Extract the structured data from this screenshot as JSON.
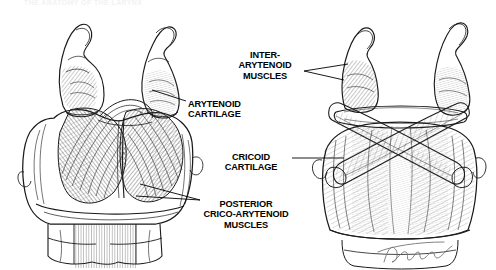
{
  "page": {
    "width": 496,
    "height": 270,
    "background_color": "#ffffff",
    "ink_color": "#1a1a1a",
    "faint_header_text": "THE ANATOMY OF THE LARYNX"
  },
  "labels": {
    "inter_arytenoid": "INTER-\nARYTENOID\nMUSCLES",
    "arytenoid_cartilage": "ARYTENOID\nCARTILAGE",
    "cricoid_cartilage": "CRICOID\nCARTILAGE",
    "posterior_crico_arytenoid": "POSTERIOR\nCRICO-ARYTENOID\nMUSCLES"
  },
  "illustrations": {
    "left": {
      "name": "posterior-larynx-view",
      "depicts": "Posterior view of larynx showing paired posterior crico-arytenoid muscles fanning from cricoid lamina to arytenoid cartilages, with tracheal rings below"
    },
    "right": {
      "name": "inter-arytenoid-view",
      "depicts": "Posterior view of larynx with crossing oblique inter-arytenoid muscles spanning between the arytenoid cartilages over the cricoid lamina"
    }
  },
  "signature": {
    "artist_mark": "Williams"
  }
}
